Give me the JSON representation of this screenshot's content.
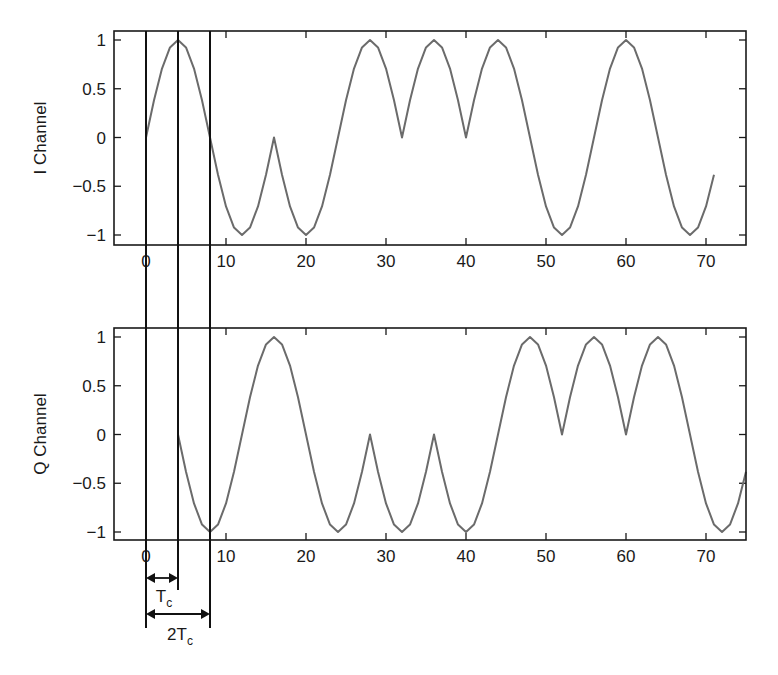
{
  "chart_data": [
    {
      "type": "line",
      "title": "",
      "xlabel": "",
      "ylabel": "I Channel",
      "xlim": [
        -4,
        75
      ],
      "ylim": [
        -1.1,
        1.1
      ],
      "xticks": [
        0,
        10,
        20,
        30,
        40,
        50,
        60,
        70
      ],
      "yticks": [
        1,
        0.5,
        0,
        -0.5,
        -1
      ],
      "ytick_labels": [
        "1",
        "0.5",
        "0",
        "−0.5",
        "−1"
      ],
      "grid": false,
      "pulse_half_period": 8,
      "segment_start": 0,
      "segment_signs": [
        1,
        -1,
        -1,
        1,
        1,
        1,
        -1,
        1,
        -1
      ],
      "x_end": 71,
      "series": [
        {
          "name": "I Channel",
          "color": "#6b6b6b",
          "x": [
            0,
            1,
            2,
            3,
            4,
            5,
            6,
            7,
            8,
            9,
            10,
            11,
            12,
            13,
            14,
            15,
            16,
            17,
            18,
            19,
            20,
            21,
            22,
            23,
            24,
            25,
            26,
            27,
            28,
            29,
            30,
            31,
            32,
            33,
            34,
            35,
            36,
            37,
            38,
            39,
            40,
            41,
            42,
            43,
            44,
            45,
            46,
            47,
            48,
            49,
            50,
            51,
            52,
            53,
            54,
            55,
            56,
            57,
            58,
            59,
            60,
            61,
            62,
            63,
            64,
            65,
            66,
            67,
            68,
            69,
            70,
            71
          ],
          "y": [
            0,
            0.383,
            0.707,
            0.924,
            1,
            0.924,
            0.707,
            0.383,
            0,
            -0.383,
            -0.707,
            -0.924,
            -1,
            -0.924,
            -0.707,
            -0.383,
            0,
            -0.383,
            -0.707,
            -0.924,
            -1,
            -0.924,
            -0.707,
            -0.383,
            0,
            0.383,
            0.707,
            0.924,
            1,
            0.924,
            0.707,
            0.383,
            0,
            0.383,
            0.707,
            0.924,
            1,
            0.924,
            0.707,
            0.383,
            0,
            0.383,
            0.707,
            0.924,
            1,
            0.924,
            0.707,
            0.383,
            0,
            -0.383,
            -0.707,
            -0.924,
            -1,
            -0.924,
            -0.707,
            -0.383,
            0,
            0.383,
            0.707,
            0.924,
            1,
            0.924,
            0.707,
            0.383,
            0,
            -0.383,
            -0.707,
            -0.924,
            -1,
            -0.924,
            -0.707,
            -0.383
          ]
        }
      ]
    },
    {
      "type": "line",
      "title": "",
      "xlabel": "",
      "ylabel": "Q Channel",
      "xlim": [
        -4,
        75
      ],
      "ylim": [
        -1.1,
        1.1
      ],
      "xticks": [
        0,
        10,
        20,
        30,
        40,
        50,
        60,
        70
      ],
      "yticks": [
        1,
        0.5,
        0,
        -0.5,
        -1
      ],
      "ytick_labels": [
        "1",
        "0.5",
        "0",
        "−0.5",
        "−1"
      ],
      "grid": false,
      "pulse_half_period": 8,
      "segment_start": 4,
      "segment_signs": [
        -1,
        1,
        -1,
        -1,
        -1,
        1,
        1,
        1,
        -1
      ],
      "x_end": 75,
      "series": [
        {
          "name": "Q Channel",
          "color": "#6b6b6b",
          "x": [
            4,
            5,
            6,
            7,
            8,
            9,
            10,
            11,
            12,
            13,
            14,
            15,
            16,
            17,
            18,
            19,
            20,
            21,
            22,
            23,
            24,
            25,
            26,
            27,
            28,
            29,
            30,
            31,
            32,
            33,
            34,
            35,
            36,
            37,
            38,
            39,
            40,
            41,
            42,
            43,
            44,
            45,
            46,
            47,
            48,
            49,
            50,
            51,
            52,
            53,
            54,
            55,
            56,
            57,
            58,
            59,
            60,
            61,
            62,
            63,
            64,
            65,
            66,
            67,
            68,
            69,
            70,
            71,
            72,
            73,
            74,
            75
          ],
          "y": [
            0,
            -0.383,
            -0.707,
            -0.924,
            -1,
            -0.924,
            -0.707,
            -0.383,
            0,
            0.383,
            0.707,
            0.924,
            1,
            0.924,
            0.707,
            0.383,
            0,
            -0.383,
            -0.707,
            -0.924,
            -1,
            -0.924,
            -0.707,
            -0.383,
            0,
            -0.383,
            -0.707,
            -0.924,
            -1,
            -0.924,
            -0.707,
            -0.383,
            0,
            -0.383,
            -0.707,
            -0.924,
            -1,
            -0.924,
            -0.707,
            -0.383,
            0,
            0.383,
            0.707,
            0.924,
            1,
            0.924,
            0.707,
            0.383,
            0,
            0.383,
            0.707,
            0.924,
            1,
            0.924,
            0.707,
            0.383,
            0,
            0.383,
            0.707,
            0.924,
            1,
            0.924,
            0.707,
            0.383,
            0,
            -0.383,
            -0.707,
            -0.924,
            -1,
            -0.924,
            -0.707,
            -0.383
          ]
        }
      ]
    }
  ],
  "annotations": {
    "vertical_markers_x": [
      0,
      4,
      8
    ],
    "tc": {
      "label": "T",
      "sub": "c",
      "from": 0,
      "to": 4
    },
    "two_tc": {
      "label": "2T",
      "sub": "c",
      "from": 0,
      "to": 8
    }
  },
  "colors": {
    "curve": "#6b6b6b",
    "axes": "#1a1a1a",
    "markers": "#111111"
  }
}
